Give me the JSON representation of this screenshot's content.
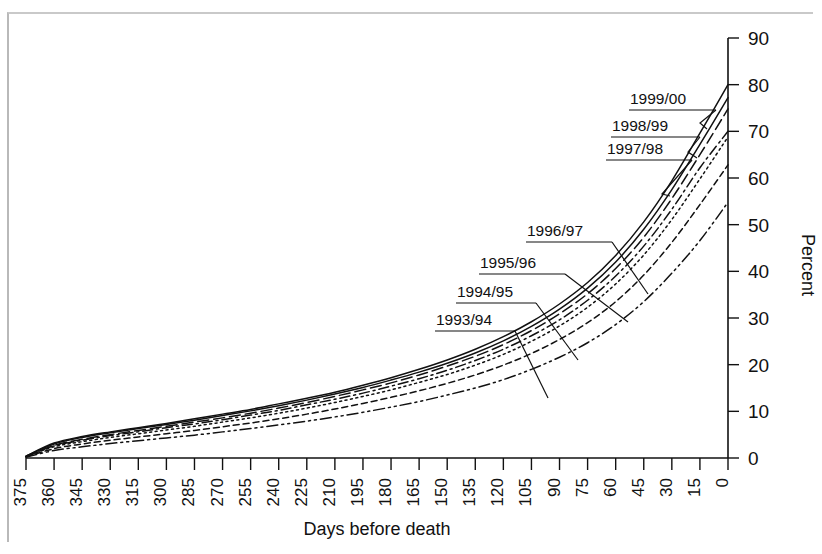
{
  "chart_data": {
    "type": "line",
    "title": "",
    "xlabel": "Days before death",
    "ylabel": "Percent",
    "xlim": [
      375,
      0
    ],
    "ylim": [
      0,
      90
    ],
    "x_inverted": true,
    "grid": false,
    "legend_position": "inline-callouts",
    "x_tick_labels": [
      "375",
      "360",
      "345",
      "330",
      "315",
      "300",
      "285",
      "270",
      "255",
      "240",
      "225",
      "210",
      "195",
      "180",
      "165",
      "150",
      "135",
      "120",
      "105",
      "90",
      "75",
      "60",
      "45",
      "30",
      "15",
      "0"
    ],
    "y_tick_labels": [
      "0",
      "10",
      "20",
      "30",
      "40",
      "50",
      "60",
      "70",
      "80",
      "90"
    ],
    "x": [
      375,
      360,
      345,
      330,
      315,
      300,
      285,
      270,
      255,
      240,
      225,
      210,
      195,
      180,
      165,
      150,
      135,
      120,
      105,
      90,
      75,
      60,
      45,
      30,
      15,
      0
    ],
    "series": [
      {
        "name": "1999/00",
        "dash": "solid",
        "values": [
          0.4,
          3.2,
          4.6,
          5.6,
          6.5,
          7.4,
          8.4,
          9.4,
          10.4,
          11.6,
          12.8,
          14.1,
          15.6,
          17.2,
          19.0,
          21.0,
          23.3,
          26.0,
          29.2,
          33.0,
          37.6,
          43.4,
          50.6,
          59.4,
          69.6,
          80.0
        ]
      },
      {
        "name": "1998/99",
        "dash": "solid",
        "values": [
          0.4,
          3.0,
          4.4,
          5.4,
          6.3,
          7.2,
          8.1,
          9.1,
          10.1,
          11.2,
          12.4,
          13.7,
          15.1,
          16.7,
          18.4,
          20.3,
          22.5,
          25.1,
          28.2,
          31.9,
          36.4,
          42.0,
          49.0,
          57.5,
          67.2,
          77.2
        ]
      },
      {
        "name": "1997/98",
        "dash": "dashed-long",
        "values": [
          0.3,
          2.7,
          4.0,
          5.0,
          5.9,
          6.8,
          7.7,
          8.6,
          9.6,
          10.7,
          11.9,
          13.2,
          14.6,
          16.1,
          17.8,
          19.7,
          21.8,
          24.3,
          27.3,
          30.9,
          35.2,
          40.6,
          47.3,
          55.6,
          65.0,
          74.8
        ]
      },
      {
        "name": "1996/97",
        "dash": "dash-dot",
        "values": [
          0.3,
          2.6,
          3.8,
          4.8,
          5.6,
          6.5,
          7.3,
          8.2,
          9.2,
          10.2,
          11.4,
          12.6,
          13.9,
          15.4,
          17.0,
          18.8,
          20.9,
          23.3,
          26.2,
          29.6,
          33.8,
          39.0,
          45.4,
          53.3,
          62.2,
          70.0
        ]
      },
      {
        "name": "1995/96",
        "dash": "dotted",
        "values": [
          0.3,
          2.4,
          3.5,
          4.4,
          5.2,
          6.0,
          6.8,
          7.7,
          8.6,
          9.6,
          10.7,
          11.9,
          13.2,
          14.6,
          16.2,
          17.9,
          19.9,
          22.2,
          25.0,
          28.3,
          32.3,
          37.3,
          43.5,
          51.1,
          59.8,
          68.8
        ]
      },
      {
        "name": "1994/95",
        "dash": "dashed-short",
        "values": [
          0.2,
          2.0,
          3.0,
          3.8,
          4.5,
          5.2,
          5.9,
          6.7,
          7.5,
          8.4,
          9.4,
          10.5,
          11.7,
          13.0,
          14.4,
          16.0,
          17.8,
          19.9,
          22.4,
          25.4,
          29.0,
          33.5,
          39.2,
          46.2,
          54.3,
          62.8
        ]
      },
      {
        "name": "1993/94",
        "dash": "dash-dot-dot",
        "values": [
          0.2,
          1.6,
          2.4,
          3.1,
          3.7,
          4.3,
          4.9,
          5.6,
          6.3,
          7.1,
          7.9,
          8.8,
          9.8,
          10.9,
          12.1,
          13.5,
          15.0,
          16.8,
          19.0,
          21.6,
          24.7,
          28.6,
          33.5,
          39.6,
          46.6,
          54.8
        ]
      }
    ],
    "callouts": [
      {
        "label": "1999/00",
        "text_x": 630,
        "text_y": 104,
        "rule_x1": 629,
        "rule_x2": 716,
        "rule_y": 110,
        "leader": [
          [
            716,
            110
          ],
          [
            700,
            123
          ],
          [
            700,
            123
          ]
        ],
        "anchor_x": 707,
        "anchor_y": 129
      },
      {
        "label": "1998/99",
        "text_x": 612,
        "text_y": 131,
        "rule_x1": 611,
        "rule_x2": 700,
        "rule_y": 137,
        "leader": [
          [
            700,
            137
          ],
          [
            688,
            152
          ],
          [
            688,
            152
          ]
        ],
        "anchor_x": 697,
        "anchor_y": 158
      },
      {
        "label": "1997/98",
        "text_x": 607,
        "text_y": 154,
        "rule_x1": 606,
        "rule_x2": 692,
        "rule_y": 160,
        "leader": [
          [
            692,
            160
          ],
          [
            662,
            194
          ],
          [
            662,
            194
          ]
        ],
        "anchor_x": 670,
        "anchor_y": 196
      },
      {
        "label": "1996/97",
        "text_x": 527,
        "text_y": 236,
        "rule_x1": 526,
        "rule_x2": 612,
        "rule_y": 242,
        "leader": [
          [
            612,
            242
          ],
          [
            648,
            294
          ],
          [
            648,
            294
          ]
        ],
        "anchor_x": 648,
        "anchor_y": 294
      },
      {
        "label": "1995/96",
        "text_x": 480,
        "text_y": 268,
        "rule_x1": 479,
        "rule_x2": 565,
        "rule_y": 274,
        "leader": [
          [
            565,
            274
          ],
          [
            628,
            322
          ],
          [
            628,
            322
          ]
        ],
        "anchor_x": 628,
        "anchor_y": 322
      },
      {
        "label": "1994/95",
        "text_x": 457,
        "text_y": 297,
        "rule_x1": 456,
        "rule_x2": 536,
        "rule_y": 303,
        "leader": [
          [
            536,
            303
          ],
          [
            578,
            360
          ],
          [
            578,
            360
          ]
        ],
        "anchor_x": 578,
        "anchor_y": 360
      },
      {
        "label": "1993/94",
        "text_x": 436,
        "text_y": 325,
        "rule_x1": 435,
        "rule_x2": 515,
        "rule_y": 331,
        "leader": [
          [
            515,
            331
          ],
          [
            548,
            398
          ],
          [
            548,
            398
          ]
        ],
        "anchor_x": 548,
        "anchor_y": 398
      }
    ]
  },
  "figure": {
    "x_axis_title": "Days before death",
    "y_axis_title": "Percent"
  }
}
